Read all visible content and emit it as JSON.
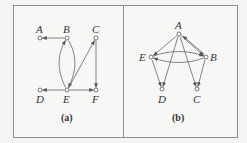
{
  "figure": {
    "panels": [
      {
        "caption": "(a)",
        "nodes": [
          {
            "id": "A",
            "label": "A",
            "x": 40,
            "y": 38
          },
          {
            "id": "B",
            "label": "B",
            "x": 67,
            "y": 38
          },
          {
            "id": "C",
            "label": "C",
            "x": 96,
            "y": 38
          },
          {
            "id": "D",
            "label": "D",
            "x": 40,
            "y": 90
          },
          {
            "id": "E",
            "label": "E",
            "x": 67,
            "y": 90
          },
          {
            "id": "F",
            "label": "F",
            "x": 96,
            "y": 90
          }
        ],
        "edges": [
          {
            "from": "B",
            "to": "A"
          },
          {
            "from": "E",
            "to": "B",
            "curved": true
          },
          {
            "from": "B",
            "to": "E",
            "curved": true
          },
          {
            "from": "E",
            "to": "C"
          },
          {
            "from": "C",
            "to": "F"
          },
          {
            "from": "E",
            "to": "D"
          },
          {
            "from": "E",
            "to": "F"
          }
        ]
      },
      {
        "caption": "(b)",
        "nodes": [
          {
            "id": "A",
            "label": "A",
            "x": 179,
            "y": 34
          },
          {
            "id": "E",
            "label": "E",
            "x": 151,
            "y": 57
          },
          {
            "id": "B",
            "label": "B",
            "x": 206,
            "y": 57
          },
          {
            "id": "D",
            "label": "D",
            "x": 162,
            "y": 89
          },
          {
            "id": "C",
            "label": "C",
            "x": 197,
            "y": 89
          }
        ],
        "edges": [
          {
            "from": "A",
            "to": "E"
          },
          {
            "from": "A",
            "to": "B"
          },
          {
            "from": "B",
            "to": "A"
          },
          {
            "from": "E",
            "to": "B",
            "curved": true
          },
          {
            "from": "B",
            "to": "E",
            "curved": true
          },
          {
            "from": "A",
            "to": "D"
          },
          {
            "from": "A",
            "to": "C"
          },
          {
            "from": "E",
            "to": "D"
          },
          {
            "from": "B",
            "to": "C"
          }
        ]
      }
    ]
  }
}
